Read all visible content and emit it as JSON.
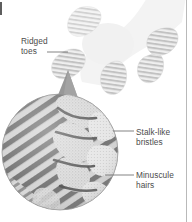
{
  "figure": {
    "background_color": "#ffffff",
    "border_color": "#b9b9b9",
    "text_color": "#4c4c4c",
    "leader_color": "#6e6e6e"
  },
  "labels": {
    "ridged_toes": {
      "line1": "Ridged",
      "line2": "toes"
    },
    "stalk_like_bristles": {
      "line1": "Stalk-like",
      "line2": "bristles"
    },
    "minuscule_hairs": {
      "line1": "Minuscule",
      "line2": "hairs"
    }
  },
  "foot": {
    "name": "gecko-foot",
    "fill": "#f2f2f2",
    "toe_count": 5,
    "toes": [
      {
        "id": "toe-1",
        "lamella_count": 12,
        "shade": "#e8e8e8"
      },
      {
        "id": "toe-2",
        "lamella_count": 13,
        "shade": "#ededed"
      },
      {
        "id": "toe-3",
        "lamella_count": 11,
        "shade": "#e3e3e3"
      },
      {
        "id": "toe-4",
        "lamella_count": 12,
        "shade": "#dcdcdc"
      },
      {
        "id": "toe-5",
        "lamella_count": 12,
        "shade": "#d6d6d6"
      }
    ]
  },
  "magnifier": {
    "name": "magnified-detail-circle",
    "center_x": 60,
    "center_y": 152,
    "radius": 58,
    "base_fill": "#cfcfcf",
    "bristle_fill": "#6d6d6d",
    "hair_fill": "#d8d8d8",
    "cone_fill": "#9a9a9a",
    "description": "Scanning-electron view: diagonal stalk-like bristles at left, clustered minuscule hairs at right"
  }
}
